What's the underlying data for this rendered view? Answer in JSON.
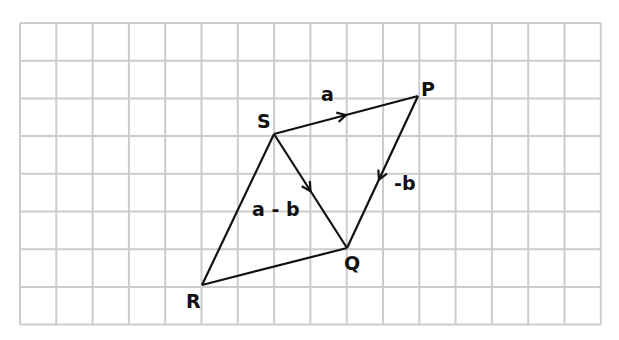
{
  "diagram": {
    "type": "vector-parallelogram-on-grid",
    "grid": {
      "left": 20,
      "top": 23,
      "cols": 16,
      "rows": 8,
      "cell_w": 36.3,
      "cell_h": 37.7,
      "line_color": "#cccccc"
    },
    "points": {
      "S": {
        "x": 274,
        "y": 134
      },
      "P": {
        "x": 418,
        "y": 96
      },
      "Q": {
        "x": 347,
        "y": 248
      },
      "R": {
        "x": 202,
        "y": 285
      }
    },
    "labels": {
      "S": "S",
      "P": "P",
      "Q": "Q",
      "R": "R",
      "a": "a",
      "neg_b": "-b",
      "a_minus_b": "a - b"
    },
    "line_color": "#111111"
  }
}
